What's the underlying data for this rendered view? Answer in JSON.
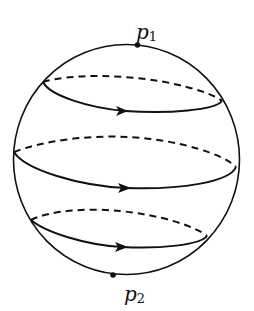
{
  "figure": {
    "colors": {
      "stroke": "#111111",
      "background": "#ffffff"
    },
    "points": [
      {
        "id": "p1",
        "label": "p",
        "subscript": "1",
        "position": "north pole"
      },
      {
        "id": "p2",
        "label": "p",
        "subscript": "2",
        "position": "south pole"
      }
    ],
    "loops": [
      {
        "name": "upper",
        "direction": "left-to-right (front)"
      },
      {
        "name": "middle",
        "direction": "left-to-right (front)"
      },
      {
        "name": "lower",
        "direction": "left-to-right (front)"
      }
    ]
  }
}
